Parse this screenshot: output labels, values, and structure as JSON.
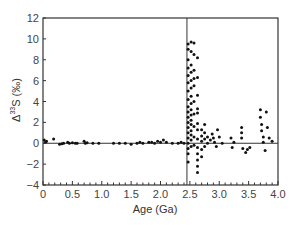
{
  "chart_data": {
    "type": "scatter",
    "title": "",
    "xlabel": "Age (Ga)",
    "ylabel_main": "Δ",
    "ylabel_sup": "33",
    "ylabel_rest": "S (‰)",
    "xlim": [
      0,
      4.0
    ],
    "ylim": [
      -4,
      12
    ],
    "x_ticks": [
      0,
      0.5,
      1.0,
      1.5,
      2.0,
      2.5,
      3.0,
      3.5,
      4.0
    ],
    "x_tick_labels": [
      "0",
      "0.5",
      "1.0",
      "1.5",
      "2.0",
      "2.5",
      "3.0",
      "3.5",
      "4.0"
    ],
    "y_ticks": [
      -4,
      -2,
      0,
      2,
      4,
      6,
      8,
      10,
      12
    ],
    "y_tick_labels": [
      "−4",
      "−2",
      "0",
      "2",
      "4",
      "6",
      "8",
      "10",
      "12"
    ],
    "grid": false,
    "legend": null,
    "reference_lines": [
      {
        "orientation": "horizontal",
        "y": 0
      },
      {
        "orientation": "vertical",
        "x": 2.45
      }
    ],
    "series": [
      {
        "name": "Δ33S measurements",
        "color": "#111111",
        "points": [
          [
            0.02,
            0.3
          ],
          [
            0.04,
            0.1
          ],
          [
            0.06,
            0.2
          ],
          [
            0.18,
            0.4
          ],
          [
            0.28,
            -0.1
          ],
          [
            0.32,
            -0.05
          ],
          [
            0.35,
            0.0
          ],
          [
            0.42,
            0.1
          ],
          [
            0.45,
            0.0
          ],
          [
            0.5,
            0.05
          ],
          [
            0.55,
            0.0
          ],
          [
            0.58,
            0.0
          ],
          [
            0.7,
            0.2
          ],
          [
            0.72,
            0.0
          ],
          [
            0.75,
            0.05
          ],
          [
            0.85,
            0.0
          ],
          [
            0.95,
            0.0
          ],
          [
            1.2,
            0.0
          ],
          [
            1.3,
            0.0
          ],
          [
            1.4,
            0.0
          ],
          [
            1.5,
            -0.1
          ],
          [
            1.6,
            0.0
          ],
          [
            1.65,
            0.1
          ],
          [
            1.7,
            0.0
          ],
          [
            1.8,
            0.1
          ],
          [
            1.85,
            0.1
          ],
          [
            1.9,
            0.0
          ],
          [
            1.95,
            0.2
          ],
          [
            2.0,
            0.1
          ],
          [
            2.05,
            0.3
          ],
          [
            2.1,
            0.1
          ],
          [
            2.2,
            0.0
          ],
          [
            2.3,
            0.0
          ],
          [
            2.35,
            0.1
          ],
          [
            2.4,
            0.0
          ],
          [
            2.47,
            9.5
          ],
          [
            2.47,
            9.0
          ],
          [
            2.47,
            8.0
          ],
          [
            2.47,
            7.2
          ],
          [
            2.47,
            6.5
          ],
          [
            2.47,
            5.8
          ],
          [
            2.47,
            5.0
          ],
          [
            2.47,
            4.2
          ],
          [
            2.47,
            3.5
          ],
          [
            2.47,
            3.0
          ],
          [
            2.47,
            2.5
          ],
          [
            2.47,
            2.0
          ],
          [
            2.47,
            1.5
          ],
          [
            2.47,
            1.0
          ],
          [
            2.47,
            0.5
          ],
          [
            2.47,
            0.0
          ],
          [
            2.47,
            -0.5
          ],
          [
            2.47,
            -1.0
          ],
          [
            2.47,
            -1.8
          ],
          [
            2.52,
            9.7
          ],
          [
            2.52,
            8.8
          ],
          [
            2.52,
            7.5
          ],
          [
            2.52,
            6.8
          ],
          [
            2.52,
            6.0
          ],
          [
            2.52,
            5.3
          ],
          [
            2.52,
            4.5
          ],
          [
            2.52,
            3.8
          ],
          [
            2.52,
            3.2
          ],
          [
            2.52,
            2.7
          ],
          [
            2.52,
            2.2
          ],
          [
            2.52,
            1.8
          ],
          [
            2.52,
            1.2
          ],
          [
            2.52,
            0.8
          ],
          [
            2.52,
            0.3
          ],
          [
            2.52,
            -0.3
          ],
          [
            2.57,
            9.6
          ],
          [
            2.57,
            8.5
          ],
          [
            2.57,
            7.0
          ],
          [
            2.57,
            6.2
          ],
          [
            2.57,
            5.5
          ],
          [
            2.57,
            4.0
          ],
          [
            2.57,
            2.8
          ],
          [
            2.57,
            1.6
          ],
          [
            2.57,
            0.6
          ],
          [
            2.57,
            -0.2
          ],
          [
            2.63,
            8.2
          ],
          [
            2.63,
            6.3
          ],
          [
            2.63,
            4.6
          ],
          [
            2.63,
            3.3
          ],
          [
            2.63,
            2.9
          ],
          [
            2.63,
            1.9
          ],
          [
            2.63,
            1.3
          ],
          [
            2.63,
            0.4
          ],
          [
            2.63,
            -0.4
          ],
          [
            2.63,
            -1.0
          ],
          [
            2.63,
            -1.6
          ],
          [
            2.63,
            -2.2
          ],
          [
            2.63,
            -2.8
          ],
          [
            2.7,
            1.3
          ],
          [
            2.7,
            0.7
          ],
          [
            2.7,
            0.2
          ],
          [
            2.7,
            -0.6
          ],
          [
            2.7,
            -1.3
          ],
          [
            2.75,
            1.8
          ],
          [
            2.75,
            1.0
          ],
          [
            2.75,
            0.4
          ],
          [
            2.75,
            -0.3
          ],
          [
            2.8,
            0.6
          ],
          [
            2.8,
            0.0
          ],
          [
            2.85,
            0.3
          ],
          [
            2.88,
            0.9
          ],
          [
            2.9,
            0.5
          ],
          [
            2.92,
            0.1
          ],
          [
            2.95,
            -0.3
          ],
          [
            2.97,
            1.3
          ],
          [
            3.0,
            0.6
          ],
          [
            3.05,
            0.0
          ],
          [
            3.2,
            0.5
          ],
          [
            3.22,
            -0.4
          ],
          [
            3.25,
            0.1
          ],
          [
            3.38,
            1.5
          ],
          [
            3.38,
            1.0
          ],
          [
            3.38,
            0.5
          ],
          [
            3.4,
            -0.5
          ],
          [
            3.45,
            -0.9
          ],
          [
            3.48,
            -0.6
          ],
          [
            3.52,
            -0.4
          ],
          [
            3.7,
            3.2
          ],
          [
            3.7,
            2.5
          ],
          [
            3.72,
            1.8
          ],
          [
            3.72,
            1.2
          ],
          [
            3.75,
            0.6
          ],
          [
            3.75,
            0.1
          ],
          [
            3.78,
            -0.7
          ],
          [
            3.8,
            3.0
          ],
          [
            3.82,
            1.5
          ],
          [
            3.85,
            0.5
          ],
          [
            3.9,
            0.2
          ]
        ]
      }
    ]
  }
}
